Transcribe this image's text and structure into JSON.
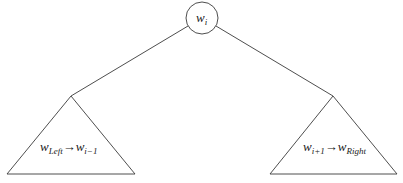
{
  "diagram": {
    "root": {
      "base": "w",
      "subscript": "i"
    },
    "left_subtree": {
      "from_base": "w",
      "from_subscript": "Left",
      "arrow": "→",
      "to_base": "w",
      "to_subscript": "i−1"
    },
    "right_subtree": {
      "from_base": "w",
      "from_subscript": "i+1",
      "arrow": "→",
      "to_base": "w",
      "to_subscript": "Right"
    },
    "colors": {
      "stroke": "#3a3a3a",
      "background": "#ffffff"
    }
  }
}
